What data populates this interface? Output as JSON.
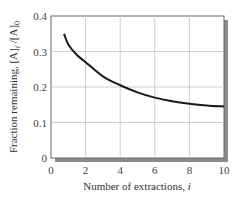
{
  "chart_data": {
    "type": "line",
    "title": "",
    "xlabel": "Number of extractions, i",
    "ylabel": "Fraction remaining, [A]i /[A]0",
    "ylabel_parts": {
      "main": "Fraction remaining, [A]",
      "sub1": "i",
      "mid": " /[A]",
      "sub2": "0"
    },
    "xlabel_parts": {
      "main": "Number of extractions, ",
      "italic": "i"
    },
    "xlim": [
      0,
      10
    ],
    "ylim": [
      0,
      0.4
    ],
    "x_ticks": [
      0,
      2,
      4,
      6,
      8,
      10
    ],
    "y_ticks": [
      0,
      0.1,
      0.2,
      0.3,
      0.4
    ],
    "x_tick_labels": [
      "0",
      "2",
      "4",
      "6",
      "8",
      "10"
    ],
    "y_tick_labels": [
      "0",
      "0.1",
      "0.2",
      "0.3",
      "0.4"
    ],
    "grid": true,
    "legend": null,
    "series": [
      {
        "name": "Fraction remaining",
        "x": [
          0.75,
          1,
          1.5,
          2,
          3,
          4,
          5,
          6,
          7,
          8,
          9,
          10
        ],
        "y": [
          0.35,
          0.32,
          0.29,
          0.27,
          0.23,
          0.205,
          0.185,
          0.17,
          0.16,
          0.153,
          0.148,
          0.145
        ],
        "color": "#1a1a1a"
      }
    ]
  },
  "colors": {
    "grid": "#cfcfcf",
    "frame": "#666666",
    "shadow": "#8a8a8a",
    "curve": "#1a1a1a"
  }
}
